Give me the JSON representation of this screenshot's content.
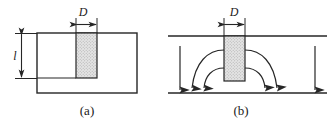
{
  "figure": {
    "type": "technical-diagram",
    "background_color": "#ffffff",
    "line_color": "#262626",
    "hatch_fill_color": "#d9d9d9",
    "panels": [
      {
        "id": "a",
        "caption": "(a)",
        "description": "Rectangular block with shaded plug of diameter D and depth l",
        "dimension_labels": [
          {
            "name": "diameter",
            "text": "D",
            "orientation": "horizontal"
          },
          {
            "name": "depth",
            "text": "l",
            "orientation": "vertical"
          }
        ]
      },
      {
        "id": "b",
        "caption": "(b)",
        "description": "Channel between two parallel walls with shaded obstruction of diameter D and flow arrows",
        "dimension_labels": [
          {
            "name": "diameter",
            "text": "D",
            "orientation": "horizontal"
          }
        ],
        "flow_arrows": {
          "straight_count": 2,
          "curved_count": 4,
          "direction": "downward"
        }
      }
    ]
  }
}
